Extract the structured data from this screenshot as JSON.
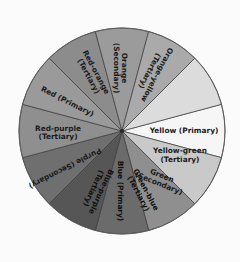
{
  "figure": {
    "background_color": "#f8f8f8",
    "outline_color": "#5a5a5a",
    "divider_color": "#3a3a3a",
    "label_color": "#1b1b1b",
    "center_x": 122,
    "center_y": 131,
    "radius": 103
  },
  "chart_data": {
    "type": "pie",
    "xlabel": "",
    "ylabel": "",
    "legend_position": "none",
    "grid": false,
    "equal_slices": true,
    "slice_angle_degrees": 30,
    "categories": [
      "Yellow (Primary)",
      "Orange-yellow (Tertiary)",
      "Orange (Secondary)",
      "Red-orange (Tertiary)",
      "Red (Primary)",
      "Red-purple (Tertiary)",
      "Purple (Secondary)",
      "Blue-purple (Tertiary)",
      "Blue (Primary)",
      "Green-blue (Tertiary)",
      "Green (Secondary)",
      "Yellow-green (Tertiary)"
    ],
    "values": [
      30,
      30,
      30,
      30,
      30,
      30,
      30,
      30,
      30,
      30,
      30,
      30
    ],
    "colors": [
      "#f6f6f6",
      "#dcdcdc",
      "#aaaaaa",
      "#9b9b9b",
      "#8c8c8c",
      "#9a9a9a",
      "#8f8f8f",
      "#6f6f6f",
      "#565656",
      "#6b6b6b",
      "#8f8f8f",
      "#c9c9c9"
    ]
  },
  "segments": [
    {
      "id": "yellow-primary",
      "name": "Yellow",
      "classification": "Primary",
      "label": "Yellow (Primary)",
      "color": "#f6f6f6",
      "start_angle": -15,
      "end_angle": 15,
      "label_angle": 0,
      "label_radius": 62,
      "text_rotation": 0,
      "dark": false
    },
    {
      "id": "yellow-green-tertiary",
      "name": "Yellow-green",
      "classification": "Tertiary",
      "label": "Yellow-green\n(Tertiary)",
      "line1": "Yellow-green",
      "line2": "(Tertiary)",
      "color": "#c9c9c9",
      "start_angle": 15,
      "end_angle": 45,
      "label_angle": 23,
      "label_radius": 63,
      "text_rotation": 0,
      "dark": false
    },
    {
      "id": "green-secondary",
      "name": "Green",
      "classification": "Secondary",
      "label": "Green\n(Secondary)",
      "line1": "Green",
      "line2": "(Secondary)",
      "color": "#8f8f8f",
      "start_angle": 45,
      "end_angle": 75,
      "label_angle": 52,
      "label_radius": 62,
      "text_rotation": 22,
      "dark": false
    },
    {
      "id": "green-blue-tertiary",
      "name": "Green-blue",
      "classification": "Tertiary",
      "label": "Green-blue\n(Tertiary)",
      "line1": "Green-blue",
      "line2": "(Tertiary)",
      "color": "#6b6b6b",
      "start_angle": 75,
      "end_angle": 105,
      "label_angle": 72,
      "label_radius": 64,
      "text_rotation": 62,
      "dark": true
    },
    {
      "id": "blue-primary",
      "name": "Blue",
      "classification": "Primary",
      "label": "Blue (Primary)",
      "color": "#565656",
      "start_angle": 105,
      "end_angle": 135,
      "label_angle": 92,
      "label_radius": 60,
      "text_rotation": 90,
      "dark": true
    },
    {
      "id": "blue-purple-tertiary",
      "name": "Blue-purple",
      "classification": "Tertiary",
      "label": "Blue-purple\n(Tertiary)",
      "line1": "Blue-purple",
      "line2": "(Tertiary)",
      "color": "#6f6f6f",
      "start_angle": 135,
      "end_angle": 165,
      "label_angle": 113,
      "label_radius": 64,
      "text_rotation": 115,
      "dark": true
    },
    {
      "id": "purple-secondary",
      "name": "Purple",
      "classification": "Secondary",
      "label": "Purple (Secondary)",
      "color": "#8f8f8f",
      "start_angle": 165,
      "end_angle": 195,
      "label_angle": 147,
      "label_radius": 68,
      "text_rotation": 153,
      "dark": false
    },
    {
      "id": "red-purple-tertiary",
      "name": "Red-purple",
      "classification": "Tertiary",
      "label": "Red-purple\n(Tertiary)",
      "line1": "Red-purple",
      "line2": "(Tertiary)",
      "color": "#9a9a9a",
      "start_angle": 195,
      "end_angle": 225,
      "label_angle": 178,
      "label_radius": 64,
      "text_rotation": 0,
      "dark": false
    },
    {
      "id": "red-primary",
      "name": "Red",
      "classification": "Primary",
      "label": "Red (Primary)",
      "color": "#8c8c8c",
      "start_angle": 225,
      "end_angle": 255,
      "label_angle": 208,
      "label_radius": 62,
      "text_rotation": 27,
      "dark": false
    },
    {
      "id": "red-orange-tertiary",
      "name": "Red-orange",
      "classification": "Tertiary",
      "label": "Red-orange\n(Tertiary)",
      "line1": "Red-orange",
      "line2": "(Tertiary)",
      "color": "#9b9b9b",
      "start_angle": 255,
      "end_angle": 285,
      "label_angle": 242,
      "label_radius": 64,
      "text_rotation": 62,
      "dark": false
    },
    {
      "id": "orange-secondary",
      "name": "Orange",
      "classification": "Secondary",
      "label": "Orange\n(Secondary)",
      "line1": "Orange",
      "line2": "(Secondary)",
      "color": "#aaaaaa",
      "start_angle": 285,
      "end_angle": 315,
      "label_angle": 268,
      "label_radius": 63,
      "text_rotation": 90,
      "dark": false
    },
    {
      "id": "orange-yellow-tertiary",
      "name": "Orange-yellow",
      "classification": "Tertiary",
      "label": "Orange-yellow\n(Tertiary)",
      "line1": "Orange-yellow",
      "line2": "(Tertiary)",
      "color": "#dcdcdc",
      "start_angle": 315,
      "end_angle": 345,
      "label_angle": 298,
      "label_radius": 66,
      "text_rotation": 118,
      "dark": false
    }
  ]
}
